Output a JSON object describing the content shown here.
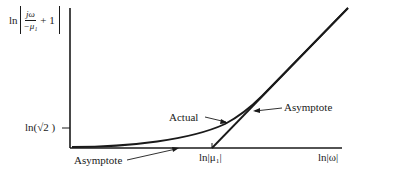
{
  "diagram": {
    "type": "bode-magnitude-asymptote",
    "y_axis_label": {
      "prefix": "ln",
      "numerator": "jω",
      "denominator": "−μ₁",
      "suffix": "+ 1"
    },
    "y_tick_label": "ln(√2 )",
    "x_tick_label": "ln|μ₁|",
    "x_axis_label": "ln|ω|",
    "annotations": {
      "actual": "Actual",
      "asymptote_low": "Asymptote",
      "asymptote_high": "Asymptote"
    },
    "colors": {
      "line": "#1a1a1a",
      "background": "#ffffff"
    }
  }
}
